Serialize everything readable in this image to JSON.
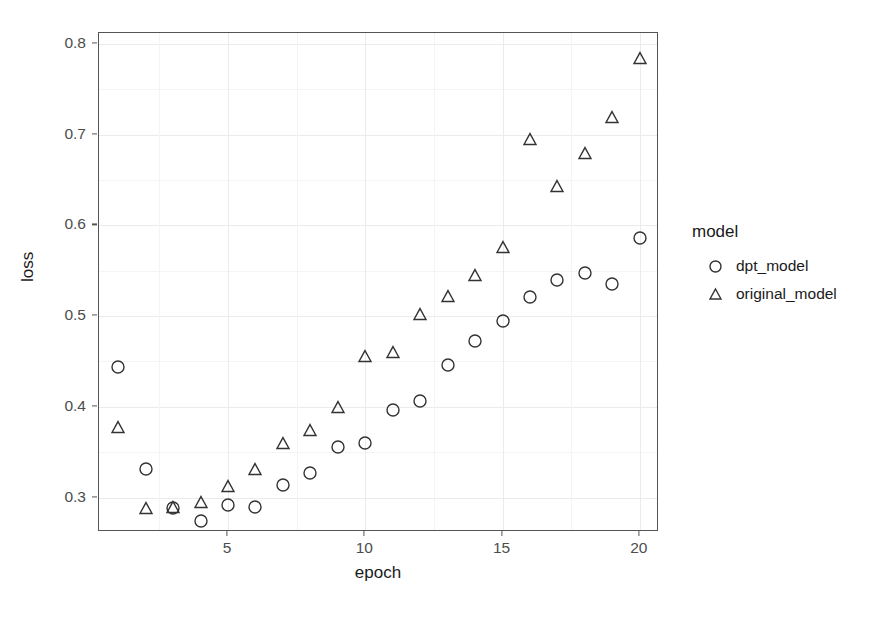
{
  "chart_data": {
    "type": "scatter",
    "title": "",
    "xlabel": "epoch",
    "ylabel": "loss",
    "xlim": [
      0.3,
      20.7
    ],
    "ylim": [
      0.262,
      0.812
    ],
    "xticks": [
      5,
      10,
      15,
      20
    ],
    "xtick_labels": [
      "5",
      "10",
      "15",
      "20"
    ],
    "yticks": [
      0.3,
      0.4,
      0.5,
      0.6,
      0.7,
      0.8
    ],
    "ytick_labels": [
      "0.3",
      "0.4",
      "0.5",
      "0.6",
      "0.7",
      "0.8"
    ],
    "grid": true,
    "grid_color": "#ebebeb",
    "legend_title": "model",
    "legend_position": "right",
    "x": [
      1,
      2,
      3,
      4,
      5,
      6,
      7,
      8,
      9,
      10,
      11,
      12,
      13,
      14,
      15,
      16,
      17,
      18,
      19,
      20
    ],
    "series": [
      {
        "name": "dpt_model",
        "marker": "circle",
        "color": "#333333",
        "values": [
          0.444,
          0.331,
          0.288,
          0.274,
          0.292,
          0.29,
          0.314,
          0.327,
          0.356,
          0.36,
          0.397,
          0.406,
          0.446,
          0.472,
          0.495,
          0.521,
          0.54,
          0.547,
          0.535,
          0.586
        ]
      },
      {
        "name": "original_model",
        "marker": "triangle",
        "color": "#333333",
        "values": [
          0.378,
          0.288,
          0.29,
          0.295,
          0.313,
          0.331,
          0.36,
          0.374,
          0.4,
          0.456,
          0.46,
          0.502,
          0.522,
          0.545,
          0.576,
          0.695,
          0.643,
          0.68,
          0.719,
          0.785
        ]
      }
    ]
  },
  "axes": {
    "ylabel": "loss",
    "xlabel": "epoch"
  },
  "legend": {
    "title": "model",
    "entries": [
      {
        "label": "dpt_model",
        "marker": "circle"
      },
      {
        "label": "original_model",
        "marker": "triangle"
      }
    ]
  }
}
